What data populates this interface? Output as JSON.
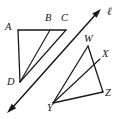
{
  "figure": {
    "background_color": "#ffffff",
    "stroke_color": "#1a1a1a",
    "width": 121,
    "height": 119,
    "labels": {
      "a": "A",
      "b": "B",
      "c": "C",
      "d": "D",
      "w": "W",
      "x": "X",
      "y": "Y",
      "z": "Z",
      "line": "ℓ"
    },
    "points": {
      "A": {
        "x": 18,
        "y": 30
      },
      "B": {
        "x": 50,
        "y": 30
      },
      "C": {
        "x": 66,
        "y": 30
      },
      "D": {
        "x": 20,
        "y": 82
      },
      "W": {
        "x": 88,
        "y": 46
      },
      "X": {
        "x": 100,
        "y": 59
      },
      "Y": {
        "x": 53,
        "y": 103
      },
      "Z": {
        "x": 103,
        "y": 92
      }
    },
    "segments": [
      {
        "name": "segment-AC",
        "from": "A",
        "to": "C"
      },
      {
        "name": "segment-AD",
        "from": "A",
        "to": "D"
      },
      {
        "name": "segment-DB",
        "from": "D",
        "to": "B"
      },
      {
        "name": "segment-DC",
        "from": "D",
        "to": "C"
      },
      {
        "name": "segment-WZ",
        "from": "W",
        "to": "Z"
      },
      {
        "name": "segment-WY",
        "from": "W",
        "to": "Y"
      },
      {
        "name": "segment-YZ",
        "from": "Y",
        "to": "Z"
      },
      {
        "name": "segment-YX",
        "from": "Y",
        "to": "X"
      }
    ],
    "transversal": {
      "name": "line-l",
      "start": {
        "x": 8,
        "y": 112
      },
      "end": {
        "x": 101,
        "y": 9
      },
      "arrows": "both",
      "label": "ℓ",
      "label_position": {
        "x": 107,
        "y": 11
      }
    },
    "label_positions": {
      "A": {
        "x": 5,
        "y": 24
      },
      "B": {
        "x": 46,
        "y": 14
      },
      "C": {
        "x": 62,
        "y": 14
      },
      "D": {
        "x": 8,
        "y": 81
      },
      "W": {
        "x": 85,
        "y": 36
      },
      "X": {
        "x": 103,
        "y": 52
      },
      "Y": {
        "x": 48,
        "y": 105
      },
      "Z": {
        "x": 106,
        "y": 92
      }
    }
  }
}
